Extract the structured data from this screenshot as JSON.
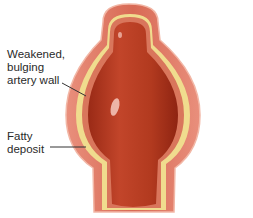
{
  "diagram": {
    "labels": [
      {
        "id": "wall",
        "lines": [
          "Weakened,",
          "bulging",
          "artery wall"
        ]
      },
      {
        "id": "fat",
        "lines": [
          "Fatty",
          "deposit"
        ]
      }
    ],
    "colors": {
      "outer_wall": "#e58a78",
      "outer_wall_edge": "#f2b7a6",
      "fatty_layer": "#f0dc8e",
      "inner_wall": "#d9765c",
      "lumen": "#b83a1e",
      "lumen_dark": "#8f2412",
      "highlight": "#f6c9bd",
      "leader_line": "#333333"
    }
  }
}
